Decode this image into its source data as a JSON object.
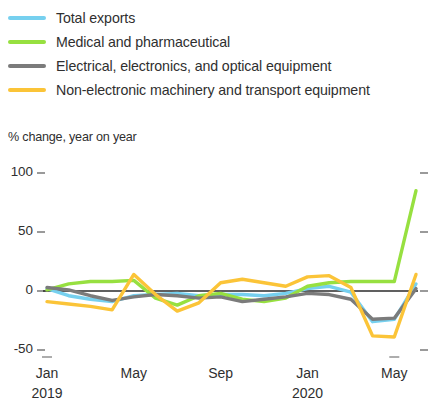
{
  "legend": {
    "items": [
      {
        "label": "Total exports",
        "color": "#76d0ef"
      },
      {
        "label": "Medical and pharmaceutical",
        "color": "#97e040"
      },
      {
        "label": "Electrical, electronics, and optical equipment",
        "color": "#7b7b7b"
      },
      {
        "label": "Non-electronic machinery and transport equipment",
        "color": "#fbc438"
      }
    ]
  },
  "chart_data": {
    "type": "line",
    "title": "",
    "subtitle": "",
    "ylabel": "% change, year on year",
    "xlabel": "",
    "ylim": [
      -50,
      100
    ],
    "yticks": [
      100,
      50,
      0,
      -50
    ],
    "ytick_labels": [
      "100",
      "50",
      "0",
      "-50"
    ],
    "grid": false,
    "zero_line": true,
    "legend_position": "top",
    "x": [
      "Jan 2019",
      "Feb 2019",
      "Mar 2019",
      "Apr 2019",
      "May 2019",
      "Jun 2019",
      "Jul 2019",
      "Aug 2019",
      "Sep 2019",
      "Oct 2019",
      "Nov 2019",
      "Dec 2019",
      "Jan 2020",
      "Feb 2020",
      "Mar 2020",
      "Apr 2020",
      "May 2020",
      "Jun 2020"
    ],
    "xtick_labels": [
      "Jan",
      "May",
      "Sep",
      "Jan",
      "May"
    ],
    "xtick_years": [
      "2019",
      "",
      "",
      "2020",
      ""
    ],
    "xtick_indices": [
      0,
      4,
      8,
      12,
      16
    ],
    "series": [
      {
        "name": "Total exports",
        "color": "#76d0ef",
        "values": [
          2,
          -4,
          -7,
          -9,
          -4,
          -3,
          -2,
          -4,
          -3,
          -3,
          -4,
          -2,
          2,
          4,
          -1,
          -26,
          -24,
          6
        ]
      },
      {
        "name": "Medical and pharmaceutical",
        "color": "#97e040",
        "values": [
          1,
          6,
          8,
          8,
          9,
          -6,
          -12,
          -4,
          -2,
          -7,
          -9,
          -6,
          4,
          7,
          8,
          8,
          8,
          85
        ]
      },
      {
        "name": "Electrical, electronics, and optical equipment",
        "color": "#7b7b7b",
        "values": [
          3,
          1,
          -4,
          -8,
          -5,
          -3,
          -4,
          -6,
          -5,
          -9,
          -7,
          -5,
          -2,
          -3,
          -7,
          -24,
          -23,
          2
        ]
      },
      {
        "name": "Non-electronic machinery and transport equipment",
        "color": "#fbc438",
        "values": [
          -9,
          -11,
          -13,
          -16,
          14,
          -3,
          -17,
          -10,
          7,
          10,
          7,
          4,
          12,
          13,
          3,
          -38,
          -39,
          14
        ]
      }
    ]
  },
  "geometry": {
    "plot_left": 47,
    "plot_right": 416,
    "y_top_value": 100,
    "y_top_px": 173,
    "y_bottom_value": -50,
    "y_bottom_px": 350
  }
}
